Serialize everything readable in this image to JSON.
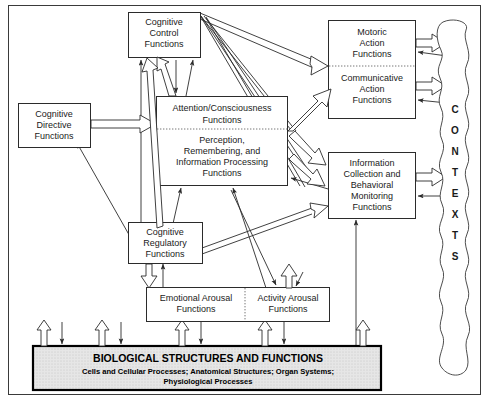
{
  "diagram": {
    "boxes": {
      "cognitive_control": {
        "lines": [
          "Cognitive",
          "Control",
          "Functions"
        ]
      },
      "cognitive_directive": {
        "lines": [
          "Cognitive",
          "Directive",
          "Functions"
        ]
      },
      "attention": {
        "upper": [
          "Attention/Consciousness",
          "Functions"
        ],
        "lower": [
          "Perception,",
          "Remembering, and",
          "Information Processing",
          "Functions"
        ]
      },
      "motoric": {
        "upper": [
          "Motoric",
          "Action",
          "Functions"
        ],
        "lower": [
          "Communicative",
          "Action",
          "Functions"
        ]
      },
      "information_collection": {
        "lines": [
          "Information",
          "Collection and",
          "Behavioral",
          "Monitoring",
          "Functions"
        ]
      },
      "cognitive_regulatory": {
        "lines": [
          "Cognitive",
          "Regulatory",
          "Functions"
        ]
      },
      "emotional_arousal": {
        "lines": [
          "Emotional Arousal",
          "Functions"
        ]
      },
      "activity_arousal": {
        "lines": [
          "Activity Arousal",
          "Functions"
        ]
      },
      "biological": {
        "heading": "BIOLOGICAL STRUCTURES AND FUNCTIONS",
        "sub_lines": [
          "Cells and Cellular Processes; Anatomical Structures; Organ Systems;",
          "Physiological Processes"
        ]
      },
      "contexts": {
        "label": "CONTEXTS",
        "letters": [
          "C",
          "O",
          "N",
          "T",
          "E",
          "X",
          "T",
          "S"
        ]
      }
    },
    "colors": {
      "line": "#2b2b2b",
      "box_fill": "#ffffff",
      "biological_fill": "#e3e3e3",
      "frame": "#3a3a3a",
      "text": "#1a1a1a"
    }
  }
}
